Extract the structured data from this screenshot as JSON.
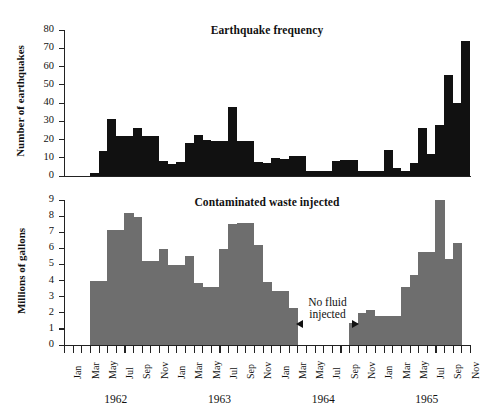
{
  "figure": {
    "width": 487,
    "height": 411,
    "background": "#ffffff"
  },
  "chart_data": [
    {
      "type": "bar",
      "id": "earthquake-frequency",
      "title": "Earthquake frequency",
      "xlabel": "",
      "ylabel": "Number of earthquakes",
      "ylim": [
        0,
        80
      ],
      "yticks": [
        0,
        10,
        20,
        30,
        40,
        50,
        60,
        70,
        80
      ],
      "grid": false,
      "bar_color": "#111111",
      "categories": [
        "Jan 1962",
        "Feb 1962",
        "Mar 1962",
        "Apr 1962",
        "May 1962",
        "Jun 1962",
        "Jul 1962",
        "Aug 1962",
        "Sep 1962",
        "Oct 1962",
        "Nov 1962",
        "Dec 1962",
        "Jan 1963",
        "Feb 1963",
        "Mar 1963",
        "Apr 1963",
        "May 1963",
        "Jun 1963",
        "Jul 1963",
        "Aug 1963",
        "Sep 1963",
        "Oct 1963",
        "Nov 1963",
        "Dec 1963",
        "Jan 1964",
        "Feb 1964",
        "Mar 1964",
        "Apr 1964",
        "May 1964",
        "Jun 1964",
        "Jul 1964",
        "Aug 1964",
        "Sep 1964",
        "Oct 1964",
        "Nov 1964",
        "Dec 1964",
        "Jan 1965",
        "Feb 1965",
        "Mar 1965",
        "Apr 1965",
        "May 1965",
        "Jun 1965",
        "Jul 1965",
        "Aug 1965",
        "Sep 1965",
        "Oct 1965",
        "Nov 1965"
      ],
      "values": [
        0,
        0,
        0,
        1.5,
        13.5,
        31.5,
        22,
        22,
        26.5,
        22,
        22,
        8,
        6.5,
        7.5,
        18,
        22.5,
        20,
        19,
        19,
        38,
        19,
        19,
        7.5,
        7,
        10,
        9.5,
        11,
        11,
        3,
        3,
        3,
        8,
        9,
        9,
        3,
        3,
        3,
        14,
        4.5,
        3,
        7,
        26.5,
        12,
        28,
        55.5,
        40,
        74
      ]
    },
    {
      "type": "bar",
      "id": "contaminated-waste-injected",
      "title": "Contaminated waste injected",
      "xlabel": "",
      "ylabel": "Millions of gallons",
      "ylim": [
        0,
        9
      ],
      "yticks": [
        0,
        1,
        2,
        3,
        4,
        5,
        6,
        7,
        8,
        9
      ],
      "grid": false,
      "bar_color": "#6e6e6e",
      "categories": [
        "Jan 1962",
        "Feb 1962",
        "Mar 1962",
        "Apr 1962",
        "May 1962",
        "Jun 1962",
        "Jul 1962",
        "Aug 1962",
        "Sep 1962",
        "Oct 1962",
        "Nov 1962",
        "Dec 1962",
        "Jan 1963",
        "Feb 1963",
        "Mar 1963",
        "Apr 1963",
        "May 1963",
        "Jun 1963",
        "Jul 1963",
        "Aug 1963",
        "Sep 1963",
        "Oct 1963",
        "Nov 1963",
        "Dec 1963",
        "Jan 1964",
        "Feb 1964",
        "Mar 1964",
        "Apr 1964",
        "May 1964",
        "Jun 1964",
        "Jul 1964",
        "Aug 1964",
        "Sep 1964",
        "Oct 1964",
        "Nov 1964",
        "Dec 1964",
        "Jan 1965",
        "Feb 1965",
        "Mar 1965",
        "Apr 1965",
        "May 1965",
        "Jun 1965",
        "Jul 1965",
        "Aug 1965",
        "Sep 1965",
        "Oct 1965",
        "Nov 1965"
      ],
      "values": [
        0,
        0,
        0,
        4.0,
        4.0,
        7.15,
        7.15,
        8.2,
        7.95,
        5.2,
        5.2,
        5.95,
        4.95,
        4.95,
        5.55,
        3.85,
        3.6,
        3.6,
        5.95,
        7.5,
        7.6,
        7.6,
        6.2,
        3.9,
        3.35,
        3.35,
        2.3,
        0,
        0,
        0,
        0,
        0,
        0,
        1.35,
        2.0,
        2.15,
        1.8,
        1.8,
        1.8,
        3.6,
        4.35,
        5.8,
        5.8,
        9.0,
        5.35,
        6.35,
        0
      ],
      "annotation": {
        "text_line1": "No fluid",
        "text_line2": "injected",
        "arrow_style": "double-headed",
        "span_from": "Nov 1963",
        "span_to": "Oct 1964"
      }
    }
  ],
  "x_axis": {
    "month_labels": [
      "Jan",
      "Mar",
      "May",
      "Jul",
      "Sep",
      "Nov",
      "Jan",
      "Mar",
      "May",
      "Jul",
      "Sep",
      "Nov",
      "Jan",
      "Mar",
      "May",
      "Jul",
      "Sep",
      "Nov",
      "Jan",
      "Mar",
      "May",
      "Jul",
      "Sep",
      "Nov"
    ],
    "year_labels": [
      "1962",
      "1963",
      "1964",
      "1965"
    ],
    "n_ticks": 47
  }
}
